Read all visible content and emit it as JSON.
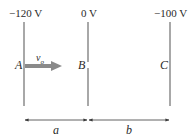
{
  "diagram": {
    "plates": [
      {
        "id": "A",
        "label": "A",
        "potential": "−120 V",
        "x": 24
      },
      {
        "id": "B",
        "label": "B",
        "potential": "0 V",
        "x": 88
      },
      {
        "id": "C",
        "label": "C",
        "potential": "−100 V",
        "x": 170
      }
    ],
    "velocity": {
      "symbol": "v",
      "subscript": "o",
      "direction": "right"
    },
    "dimensions": [
      {
        "label": "a",
        "from": "A",
        "to": "B"
      },
      {
        "label": "b",
        "from": "B",
        "to": "C"
      }
    ],
    "colors": {
      "plate": "#6e6e6e",
      "arrow": "#8a8a8a",
      "text": "#2a2a2a",
      "dimension": "#3a3a3a"
    }
  }
}
